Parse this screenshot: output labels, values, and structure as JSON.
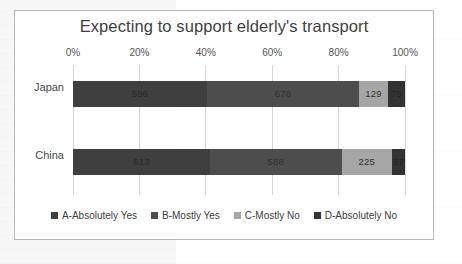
{
  "chart_data": {
    "type": "bar",
    "subtype": "stacked-horizontal-100pct",
    "title": "Expecting to support elderly's transport",
    "xlabel": "",
    "ylabel": "",
    "categories": [
      "Japan",
      "China"
    ],
    "xlim": [
      0,
      100
    ],
    "xtick_labels": [
      "0%",
      "20%",
      "40%",
      "60%",
      "80%",
      "100%"
    ],
    "xtick_values": [
      0,
      20,
      40,
      60,
      80,
      100
    ],
    "grid": true,
    "legend_position": "bottom",
    "series": [
      {
        "name": "A-Absolutely Yes",
        "color": "#3f3f3f",
        "values": [
          596,
          613
        ],
        "percents": [
          40.3,
          41.3
        ]
      },
      {
        "name": "B-Mostly Yes",
        "color": "#4d4d4d",
        "values": [
          678,
          588
        ],
        "percents": [
          45.9,
          39.6
        ]
      },
      {
        "name": "C-Mostly No",
        "color": "#a6a6a6",
        "values": [
          129,
          225
        ],
        "percents": [
          8.7,
          15.2
        ]
      },
      {
        "name": "D-Absolutely No",
        "color": "#333333",
        "values": [
          75,
          57
        ],
        "percents": [
          5.1,
          3.9
        ]
      }
    ],
    "bar_labels": {
      "Japan": [
        "596",
        "678",
        "129",
        "75"
      ],
      "China": [
        "613",
        "588",
        "225",
        "57"
      ]
    }
  },
  "chart": {
    "title": "Expecting to support elderly's transport",
    "axis": {
      "ticks": [
        {
          "label": "0%",
          "pct": 0
        },
        {
          "label": "20%",
          "pct": 20
        },
        {
          "label": "40%",
          "pct": 40
        },
        {
          "label": "60%",
          "pct": 60
        },
        {
          "label": "80%",
          "pct": 80
        },
        {
          "label": "100%",
          "pct": 100
        }
      ]
    },
    "rows": [
      {
        "label": "Japan",
        "segments": [
          {
            "label": "596",
            "pct": 40.3,
            "color": "#3f3f3f",
            "key": "a"
          },
          {
            "label": "678",
            "pct": 45.9,
            "color": "#4d4d4d",
            "key": "b"
          },
          {
            "label": "129",
            "pct": 8.7,
            "color": "#a6a6a6",
            "key": "c"
          },
          {
            "label": "75",
            "pct": 5.1,
            "color": "#333333",
            "key": "d"
          }
        ]
      },
      {
        "label": "China",
        "segments": [
          {
            "label": "613",
            "pct": 41.3,
            "color": "#3f3f3f",
            "key": "a"
          },
          {
            "label": "588",
            "pct": 39.6,
            "color": "#4d4d4d",
            "key": "b"
          },
          {
            "label": "225",
            "pct": 15.2,
            "color": "#a6a6a6",
            "key": "c"
          },
          {
            "label": "57",
            "pct": 3.9,
            "color": "#333333",
            "key": "d"
          }
        ]
      }
    ],
    "legend": [
      {
        "label": "A-Absolutely Yes",
        "color": "#3f3f3f"
      },
      {
        "label": "B-Mostly Yes",
        "color": "#4d4d4d"
      },
      {
        "label": "C-Mostly No",
        "color": "#a6a6a6"
      },
      {
        "label": "D-Absolutely No",
        "color": "#333333"
      }
    ]
  },
  "caption": {
    "text": ""
  }
}
